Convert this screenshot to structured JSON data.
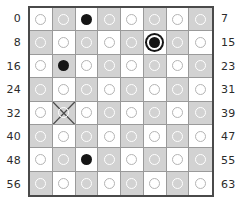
{
  "figure": {
    "type": "chessboard-square-index-diagram",
    "board": {
      "rows": 8,
      "columns": 8,
      "light_color": "#ffffff",
      "dark_color": "#d2d2d2",
      "border_color": "#4a4a4a",
      "gridline_color": "#9a9a9a"
    },
    "left_labels": [
      "0",
      "8",
      "16",
      "24",
      "32",
      "40",
      "48",
      "56"
    ],
    "right_labels": [
      "7",
      "15",
      "23",
      "31",
      "39",
      "47",
      "55",
      "63"
    ],
    "markers": {
      "empty_label": "empty-square-circle",
      "filled_label": "filled-square-circle",
      "ringed_label": "highlighted-square-circle",
      "cross_label": "crossed-out-square"
    },
    "squares": [
      {
        "index": "0",
        "row": 0,
        "col": 0,
        "shade": "light",
        "marker": "empty"
      },
      {
        "index": "1",
        "row": 0,
        "col": 1,
        "shade": "dark",
        "marker": "empty"
      },
      {
        "index": "2",
        "row": 0,
        "col": 2,
        "shade": "light",
        "marker": "filled"
      },
      {
        "index": "3",
        "row": 0,
        "col": 3,
        "shade": "dark",
        "marker": "empty"
      },
      {
        "index": "4",
        "row": 0,
        "col": 4,
        "shade": "light",
        "marker": "empty"
      },
      {
        "index": "5",
        "row": 0,
        "col": 5,
        "shade": "dark",
        "marker": "empty"
      },
      {
        "index": "6",
        "row": 0,
        "col": 6,
        "shade": "light",
        "marker": "empty"
      },
      {
        "index": "7",
        "row": 0,
        "col": 7,
        "shade": "dark",
        "marker": "empty"
      },
      {
        "index": "8",
        "row": 1,
        "col": 0,
        "shade": "dark",
        "marker": "empty"
      },
      {
        "index": "9",
        "row": 1,
        "col": 1,
        "shade": "light",
        "marker": "empty"
      },
      {
        "index": "10",
        "row": 1,
        "col": 2,
        "shade": "dark",
        "marker": "empty"
      },
      {
        "index": "11",
        "row": 1,
        "col": 3,
        "shade": "light",
        "marker": "empty"
      },
      {
        "index": "12",
        "row": 1,
        "col": 4,
        "shade": "dark",
        "marker": "empty"
      },
      {
        "index": "13",
        "row": 1,
        "col": 5,
        "shade": "light",
        "marker": "ringed"
      },
      {
        "index": "14",
        "row": 1,
        "col": 6,
        "shade": "dark",
        "marker": "empty"
      },
      {
        "index": "15",
        "row": 1,
        "col": 7,
        "shade": "light",
        "marker": "empty"
      },
      {
        "index": "16",
        "row": 2,
        "col": 0,
        "shade": "light",
        "marker": "empty"
      },
      {
        "index": "17",
        "row": 2,
        "col": 1,
        "shade": "dark",
        "marker": "filled"
      },
      {
        "index": "18",
        "row": 2,
        "col": 2,
        "shade": "light",
        "marker": "empty"
      },
      {
        "index": "19",
        "row": 2,
        "col": 3,
        "shade": "dark",
        "marker": "empty"
      },
      {
        "index": "20",
        "row": 2,
        "col": 4,
        "shade": "light",
        "marker": "empty"
      },
      {
        "index": "21",
        "row": 2,
        "col": 5,
        "shade": "dark",
        "marker": "empty"
      },
      {
        "index": "22",
        "row": 2,
        "col": 6,
        "shade": "light",
        "marker": "empty"
      },
      {
        "index": "23",
        "row": 2,
        "col": 7,
        "shade": "dark",
        "marker": "empty"
      },
      {
        "index": "24",
        "row": 3,
        "col": 0,
        "shade": "dark",
        "marker": "empty"
      },
      {
        "index": "25",
        "row": 3,
        "col": 1,
        "shade": "light",
        "marker": "empty"
      },
      {
        "index": "26",
        "row": 3,
        "col": 2,
        "shade": "dark",
        "marker": "empty"
      },
      {
        "index": "27",
        "row": 3,
        "col": 3,
        "shade": "light",
        "marker": "empty"
      },
      {
        "index": "28",
        "row": 3,
        "col": 4,
        "shade": "dark",
        "marker": "empty"
      },
      {
        "index": "29",
        "row": 3,
        "col": 5,
        "shade": "light",
        "marker": "empty"
      },
      {
        "index": "30",
        "row": 3,
        "col": 6,
        "shade": "dark",
        "marker": "empty"
      },
      {
        "index": "31",
        "row": 3,
        "col": 7,
        "shade": "light",
        "marker": "empty"
      },
      {
        "index": "32",
        "row": 4,
        "col": 0,
        "shade": "light",
        "marker": "empty"
      },
      {
        "index": "33",
        "row": 4,
        "col": 1,
        "shade": "dark",
        "marker": "cross"
      },
      {
        "index": "34",
        "row": 4,
        "col": 2,
        "shade": "light",
        "marker": "empty"
      },
      {
        "index": "35",
        "row": 4,
        "col": 3,
        "shade": "dark",
        "marker": "empty"
      },
      {
        "index": "36",
        "row": 4,
        "col": 4,
        "shade": "light",
        "marker": "empty"
      },
      {
        "index": "37",
        "row": 4,
        "col": 5,
        "shade": "dark",
        "marker": "empty"
      },
      {
        "index": "38",
        "row": 4,
        "col": 6,
        "shade": "light",
        "marker": "empty"
      },
      {
        "index": "39",
        "row": 4,
        "col": 7,
        "shade": "dark",
        "marker": "empty"
      },
      {
        "index": "40",
        "row": 5,
        "col": 0,
        "shade": "dark",
        "marker": "empty"
      },
      {
        "index": "41",
        "row": 5,
        "col": 1,
        "shade": "light",
        "marker": "empty"
      },
      {
        "index": "42",
        "row": 5,
        "col": 2,
        "shade": "dark",
        "marker": "empty"
      },
      {
        "index": "43",
        "row": 5,
        "col": 3,
        "shade": "light",
        "marker": "empty"
      },
      {
        "index": "44",
        "row": 5,
        "col": 4,
        "shade": "dark",
        "marker": "empty"
      },
      {
        "index": "45",
        "row": 5,
        "col": 5,
        "shade": "light",
        "marker": "empty"
      },
      {
        "index": "46",
        "row": 5,
        "col": 6,
        "shade": "dark",
        "marker": "empty"
      },
      {
        "index": "47",
        "row": 5,
        "col": 7,
        "shade": "light",
        "marker": "empty"
      },
      {
        "index": "48",
        "row": 6,
        "col": 0,
        "shade": "light",
        "marker": "empty"
      },
      {
        "index": "49",
        "row": 6,
        "col": 1,
        "shade": "dark",
        "marker": "empty"
      },
      {
        "index": "50",
        "row": 6,
        "col": 2,
        "shade": "light",
        "marker": "filled"
      },
      {
        "index": "51",
        "row": 6,
        "col": 3,
        "shade": "dark",
        "marker": "empty"
      },
      {
        "index": "52",
        "row": 6,
        "col": 4,
        "shade": "light",
        "marker": "empty"
      },
      {
        "index": "53",
        "row": 6,
        "col": 5,
        "shade": "dark",
        "marker": "empty"
      },
      {
        "index": "54",
        "row": 6,
        "col": 6,
        "shade": "light",
        "marker": "empty"
      },
      {
        "index": "55",
        "row": 6,
        "col": 7,
        "shade": "dark",
        "marker": "empty"
      },
      {
        "index": "56",
        "row": 7,
        "col": 0,
        "shade": "dark",
        "marker": "empty"
      },
      {
        "index": "57",
        "row": 7,
        "col": 1,
        "shade": "light",
        "marker": "empty"
      },
      {
        "index": "58",
        "row": 7,
        "col": 2,
        "shade": "dark",
        "marker": "empty"
      },
      {
        "index": "59",
        "row": 7,
        "col": 3,
        "shade": "light",
        "marker": "empty"
      },
      {
        "index": "60",
        "row": 7,
        "col": 4,
        "shade": "dark",
        "marker": "empty"
      },
      {
        "index": "61",
        "row": 7,
        "col": 5,
        "shade": "light",
        "marker": "empty"
      },
      {
        "index": "62",
        "row": 7,
        "col": 6,
        "shade": "dark",
        "marker": "empty"
      },
      {
        "index": "63",
        "row": 7,
        "col": 7,
        "shade": "light",
        "marker": "empty"
      }
    ]
  }
}
